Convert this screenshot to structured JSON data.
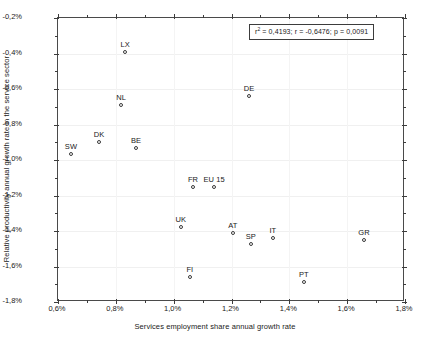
{
  "chart_data": {
    "type": "scatter",
    "title": "",
    "xlabel": "Services employment share annual growth rate",
    "ylabel": "Relative productivity annual growth rate in the service sector",
    "xlim": [
      0.6,
      1.8
    ],
    "ylim": [
      -1.8,
      -0.2
    ],
    "xticks": [
      "0,6%",
      "0,8%",
      "1,0%",
      "1,2%",
      "1,4%",
      "1,6%",
      "1,8%"
    ],
    "xtick_values": [
      0.6,
      0.8,
      1.0,
      1.2,
      1.4,
      1.6,
      1.8
    ],
    "yticks": [
      "-0,2%",
      "-0,4%",
      "-0,6%",
      "-0,8%",
      "-1,0%",
      "-1,2%",
      "-1,4%",
      "-1,6%",
      "-1,8%"
    ],
    "ytick_values": [
      -0.2,
      -0.4,
      -0.6,
      -0.8,
      -1.0,
      -1.2,
      -1.4,
      -1.6,
      -1.8
    ],
    "grid": true,
    "legend": "none",
    "minor_ticks": true,
    "points": [
      {
        "label": "SW",
        "x": 0.645,
        "y": -0.966
      },
      {
        "label": "DK",
        "x": 0.742,
        "y": -0.899
      },
      {
        "label": "BE",
        "x": 0.87,
        "y": -0.932
      },
      {
        "label": "LX",
        "x": 0.832,
        "y": -0.392
      },
      {
        "label": "NL",
        "x": 0.818,
        "y": -0.69
      },
      {
        "label": "DE",
        "x": 1.261,
        "y": -0.639
      },
      {
        "label": "FR",
        "x": 1.067,
        "y": -1.152
      },
      {
        "label": "EU 15",
        "x": 1.14,
        "y": -1.152
      },
      {
        "label": "UK",
        "x": 1.025,
        "y": -1.378
      },
      {
        "label": "AT",
        "x": 1.205,
        "y": -1.411
      },
      {
        "label": "IT",
        "x": 1.343,
        "y": -1.439
      },
      {
        "label": "SP",
        "x": 1.267,
        "y": -1.473
      },
      {
        "label": "GR",
        "x": 1.658,
        "y": -1.451
      },
      {
        "label": "PT",
        "x": 1.45,
        "y": -1.687
      },
      {
        "label": "FI",
        "x": 1.056,
        "y": -1.659
      }
    ],
    "annotation": {
      "r_squared_prefix": "r",
      "r_squared_exponent": "2",
      "text": " = 0,4193;  r = -0,6476;  p = 0,0091",
      "full_text": "r² = 0,4193;  r = -0,6476;  p = 0,0091",
      "r_squared": 0.4193,
      "r": -0.6476,
      "p": 0.0091
    }
  }
}
